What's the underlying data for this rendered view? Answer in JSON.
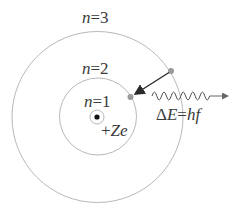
{
  "diagram": {
    "orbits": [
      {
        "label_var": "n",
        "label_eq": "=",
        "label_num": "1",
        "n": 1
      },
      {
        "label_var": "n",
        "label_eq": "=",
        "label_num": "2",
        "n": 2
      },
      {
        "label_var": "n",
        "label_eq": "=",
        "label_num": "3",
        "n": 3
      }
    ],
    "nucleus": {
      "sign": "+",
      "charge_var": "Ze"
    },
    "transition": {
      "from_n": 3,
      "to_n": 2
    },
    "photon": {
      "delta": "Δ",
      "energy_var": "E",
      "eq": "=",
      "hf": "hf"
    },
    "colors": {
      "orbit": "#b8b8b8",
      "electron": "#9a9a9a",
      "arrow": "#2a2a2a",
      "wave": "#555555",
      "nucleus": "#111111",
      "text": "#3a3a3a"
    }
  }
}
